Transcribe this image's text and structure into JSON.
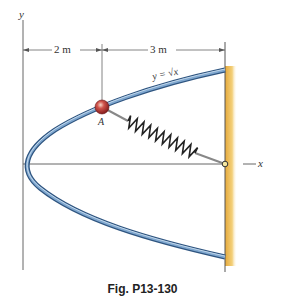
{
  "figure": {
    "caption": "Fig. P13-130",
    "axis_labels": {
      "y": "y",
      "x": "x"
    },
    "dimensions": {
      "left": "2 m",
      "right": "3 m"
    },
    "curve_label": "y = √x",
    "point_label": "A",
    "colors": {
      "rod": "#4f7fae",
      "rod_highlight": "#b8d2ea",
      "ball": "#b0262a",
      "wall": "#e8b84a",
      "axis": "#555555"
    }
  }
}
